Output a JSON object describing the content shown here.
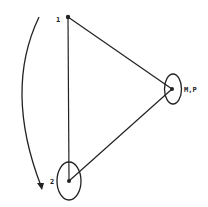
{
  "diagram": {
    "nodes": [
      {
        "id": "1",
        "label": "1",
        "x": 68,
        "y": 17,
        "encircled": false
      },
      {
        "id": "2",
        "label": "2",
        "x": 69,
        "y": 181,
        "encircled": true
      },
      {
        "id": "MP",
        "label": "M,P",
        "x": 172,
        "y": 89,
        "encircled": true
      }
    ],
    "edges": [
      {
        "from": "1",
        "to": "2"
      },
      {
        "from": "1",
        "to": "MP"
      },
      {
        "from": "2",
        "to": "MP"
      }
    ],
    "arrow": {
      "description": "curved arrow from near node 1 down to near node 2",
      "direction": "downward"
    },
    "colors": {
      "stroke": "#222222",
      "background": "#ffffff"
    }
  }
}
